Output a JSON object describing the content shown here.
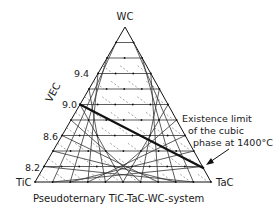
{
  "diagram": {
    "title": "Pseudoternary TiC-TaC-WC-system",
    "vertices": {
      "top": "WC",
      "left": "TiC",
      "right": "TaC"
    },
    "axis_label": "VEC",
    "vec_ticks": [
      "9.4",
      "9.0",
      "8.6",
      "8.2"
    ],
    "grid_divisions": 10,
    "annotation": {
      "line1": "Existence limit",
      "line2": "of the cubic",
      "line3": "phase at 1400°C"
    },
    "limit_line": {
      "from_vec": "9.0",
      "to_edge": "WC-TaC"
    },
    "colors": {
      "ink": "#1a1a1a",
      "grid": "#333333",
      "dashed": "#666666"
    }
  }
}
